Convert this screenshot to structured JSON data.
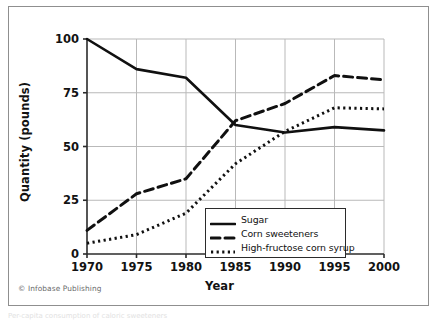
{
  "figure": {
    "copyright": "© Infobase Publishing",
    "caption_partial": "Per-capita consumption of caloric sweeteners"
  },
  "chart_data": {
    "type": "line",
    "title": "",
    "xlabel": "Year",
    "ylabel": "Quantity (pounds)",
    "x": [
      1970,
      1975,
      1980,
      1985,
      1990,
      1995,
      2000
    ],
    "xticklabels": [
      "1970",
      "1975",
      "1980",
      "1985",
      "1990",
      "1995",
      "2000"
    ],
    "yticks": [
      0,
      25,
      50,
      75,
      100
    ],
    "yticklabels": [
      "0",
      "25",
      "50",
      "75",
      "100"
    ],
    "xlim": [
      1970,
      2000
    ],
    "ylim": [
      0,
      100
    ],
    "grid": true,
    "legend_position": "lower right",
    "series": [
      {
        "name": "Sugar",
        "style": "solid",
        "color": "#101010",
        "values": [
          100,
          86,
          82,
          60,
          56.5,
          59,
          57.5
        ]
      },
      {
        "name": "Corn sweeteners",
        "style": "dashed",
        "color": "#101010",
        "values": [
          11,
          28,
          35,
          62,
          70,
          83,
          81
        ]
      },
      {
        "name": "High-fructose corn syrup",
        "style": "dotted",
        "color": "#101010",
        "values": [
          5,
          9,
          19,
          42,
          57,
          68,
          67.5
        ]
      }
    ]
  },
  "colors": {
    "frame": "#8f8f8f",
    "axis": "#2b2b2b",
    "grid": "#b9b9b9",
    "text": "#121212",
    "copyright": "#6a6a6a"
  }
}
